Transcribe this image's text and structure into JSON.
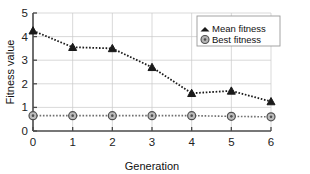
{
  "chart_data": {
    "type": "line",
    "title": "",
    "xlabel": "Generation",
    "ylabel": "Fitness value",
    "x": [
      0,
      1,
      2,
      3,
      4,
      5,
      6
    ],
    "xlim": [
      0,
      6
    ],
    "ylim": [
      0,
      5
    ],
    "xticks": [
      "0",
      "1",
      "2",
      "3",
      "4",
      "5",
      "6"
    ],
    "yticks": [
      "0",
      "1",
      "2",
      "3",
      "4",
      "5"
    ],
    "grid": true,
    "legend_position": "top-right",
    "series": [
      {
        "name": "Mean fitness",
        "marker": "triangle",
        "color": "#1a1a1a",
        "linestyle": "dotted",
        "values": [
          4.25,
          3.55,
          3.5,
          2.7,
          1.6,
          1.7,
          1.25
        ]
      },
      {
        "name": "Best fitness",
        "marker": "circle",
        "color": "#6f6f6f",
        "linestyle": "dotted",
        "values": [
          0.65,
          0.65,
          0.65,
          0.65,
          0.65,
          0.62,
          0.6
        ]
      }
    ]
  },
  "legend": {
    "entries": [
      {
        "label": "Mean fitness"
      },
      {
        "label": "Best fitness"
      }
    ]
  },
  "axes": {
    "x_title": "Generation",
    "y_title": "Fitness value",
    "x_tick_labels": [
      "0",
      "1",
      "2",
      "3",
      "4",
      "5",
      "6"
    ],
    "y_tick_labels": [
      "0",
      "1",
      "2",
      "3",
      "4",
      "5"
    ]
  },
  "colors": {
    "mean_series": "#1a1a1a",
    "best_series": "#6f6f6f",
    "grid": "#c9c9c9",
    "axis": "#4a4a4a",
    "background": "#ffffff"
  }
}
